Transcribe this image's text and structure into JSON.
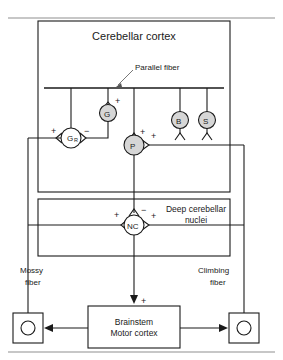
{
  "figure": {
    "title_box": "Cerebellar cortex",
    "nuclei_box_line1": "Deep cerebellar",
    "nuclei_box_line2": "nuclei",
    "brainstem_line1": "Brainstem",
    "brainstem_line2": "Motor cortex",
    "parallel_fiber_label": "Parallel fiber",
    "mossy_fiber_line1": "Mossy",
    "mossy_fiber_line2": "fiber",
    "climbing_fiber_line1": "Climbing",
    "climbing_fiber_line2": "fiber"
  },
  "cells": [
    {
      "id": "granule",
      "label": "G",
      "sub": "R",
      "full_name": "granule cell",
      "fill": "open",
      "x": 71,
      "y": 138
    },
    {
      "id": "golgi",
      "label": "G",
      "sub": "",
      "full_name": "Golgi cell",
      "fill": "shaded",
      "x": 108,
      "y": 113
    },
    {
      "id": "purkinje",
      "label": "P",
      "sub": "",
      "full_name": "Purkinje cell",
      "fill": "shaded",
      "x": 134,
      "y": 145
    },
    {
      "id": "basket",
      "label": "B",
      "sub": "",
      "full_name": "basket cell",
      "fill": "shaded",
      "x": 180,
      "y": 120
    },
    {
      "id": "stellate",
      "label": "S",
      "sub": "",
      "full_name": "stellate cell",
      "fill": "shaded",
      "x": 207,
      "y": 120
    },
    {
      "id": "nuclear",
      "label": "NC",
      "sub": "",
      "full_name": "nuclear cell",
      "fill": "open",
      "x": 134,
      "y": 225
    }
  ],
  "signs": [
    {
      "for": "granule-input",
      "symbol": "+",
      "x": 51,
      "y": 131
    },
    {
      "for": "granule-output",
      "symbol": "−",
      "x": 86,
      "y": 131
    },
    {
      "for": "golgi-input",
      "symbol": "+",
      "x": 117,
      "y": 101
    },
    {
      "for": "purkinje-input",
      "symbol": "+",
      "x": 143,
      "y": 131
    },
    {
      "for": "purkinje-output",
      "symbol": "+",
      "x": 152,
      "y": 137
    },
    {
      "for": "nc-input-top",
      "symbol": "−",
      "x": 143,
      "y": 210
    },
    {
      "for": "nc-input-left",
      "symbol": "+",
      "x": 113,
      "y": 215
    },
    {
      "for": "nc-output-right",
      "symbol": "+",
      "x": 152,
      "y": 215
    },
    {
      "for": "brainstem-input",
      "symbol": "+",
      "x": 143,
      "y": 305
    }
  ],
  "colors": {
    "ink": "#1a1a1a",
    "soma_shaded_fill": "#d6d6d6",
    "soma_open_fill": "#ffffff",
    "rule": "#8f8f8f",
    "background": "#ffffff"
  }
}
